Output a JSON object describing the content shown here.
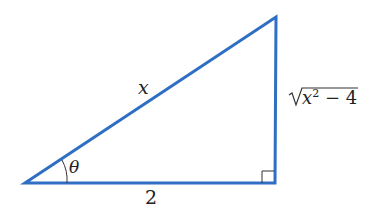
{
  "diagram": {
    "type": "right-triangle",
    "stroke_color": "#2e6fc4",
    "vertices": {
      "A": [
        25,
        183
      ],
      "B": [
        275,
        183
      ],
      "C": [
        276,
        17
      ]
    },
    "labels": {
      "hypotenuse": "x",
      "adjacent": "2",
      "opposite_radicand": "x",
      "opposite_exponent": "2",
      "opposite_rest": "− 4",
      "angle": "θ"
    },
    "right_angle_marker": true
  }
}
